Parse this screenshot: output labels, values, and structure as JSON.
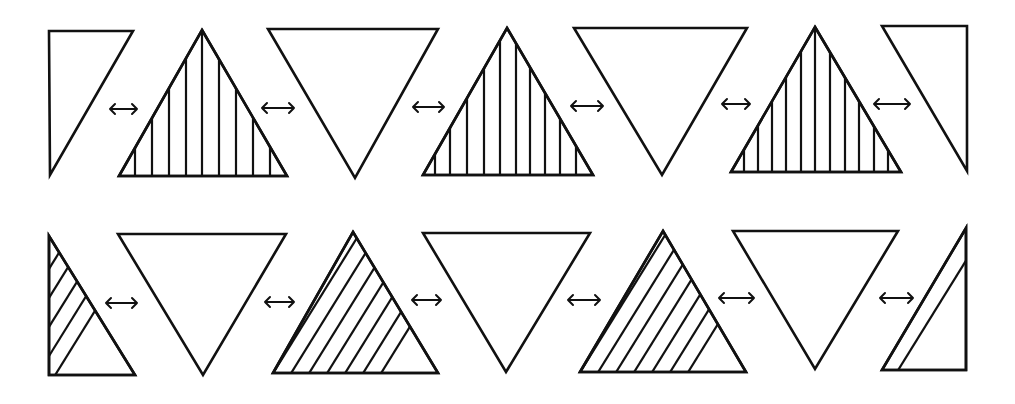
{
  "diagram": {
    "colors": {
      "line": "#111111",
      "background": "#ffffff"
    },
    "rows": [
      {
        "name": "row-1",
        "hatch_style": "vertical",
        "shapes": [
          {
            "id": "r1-t1",
            "kind": "half-triangle-left",
            "points": [
              [
                49,
                31
              ],
              [
                133,
                31
              ],
              [
                50,
                175
              ]
            ],
            "hatch": null
          },
          {
            "id": "r1-t2",
            "kind": "triangle-up",
            "points": [
              [
                202,
                30
              ],
              [
                287,
                176
              ],
              [
                119,
                176
              ]
            ],
            "hatch": {
              "type": "vertical",
              "xs": [
                135,
                152,
                169,
                186,
                202,
                219,
                236,
                253,
                270
              ]
            }
          },
          {
            "id": "r1-t3",
            "kind": "triangle-down",
            "points": [
              [
                268,
                29
              ],
              [
                438,
                29
              ],
              [
                355,
                178
              ]
            ],
            "hatch": null
          },
          {
            "id": "r1-t4",
            "kind": "triangle-up",
            "points": [
              [
                507,
                28
              ],
              [
                593,
                175
              ],
              [
                423,
                175
              ]
            ],
            "hatch": {
              "type": "vertical",
              "xs": [
                435,
                450,
                467,
                484,
                500,
                516,
                530,
                545,
                560,
                576
              ]
            }
          },
          {
            "id": "r1-t5",
            "kind": "triangle-down",
            "points": [
              [
                574,
                28
              ],
              [
                747,
                28
              ],
              [
                662,
                175
              ]
            ],
            "hatch": null
          },
          {
            "id": "r1-t6",
            "kind": "triangle-up",
            "points": [
              [
                815,
                27
              ],
              [
                901,
                172
              ],
              [
                731,
                172
              ]
            ],
            "hatch": {
              "type": "vertical",
              "xs": [
                744,
                758,
                772,
                786,
                801,
                815,
                830,
                845,
                859,
                874,
                888
              ]
            }
          },
          {
            "id": "r1-t7",
            "kind": "half-triangle-right",
            "points": [
              [
                882,
                26
              ],
              [
                967,
                26
              ],
              [
                967,
                171
              ]
            ],
            "hatch": null
          }
        ],
        "arrows": [
          {
            "id": "r1-a1",
            "x1": 110,
            "x2": 137,
            "y": 109
          },
          {
            "id": "r1-a2",
            "x1": 262,
            "x2": 294,
            "y": 108
          },
          {
            "id": "r1-a3",
            "x1": 413,
            "x2": 444,
            "y": 107
          },
          {
            "id": "r1-a4",
            "x1": 571,
            "x2": 603,
            "y": 106
          },
          {
            "id": "r1-a5",
            "x1": 722,
            "x2": 750,
            "y": 104
          },
          {
            "id": "r1-a6",
            "x1": 874,
            "x2": 910,
            "y": 104
          }
        ]
      },
      {
        "name": "row-2",
        "hatch_style": "diagonal",
        "shapes": [
          {
            "id": "r2-t1",
            "kind": "half-triangle-left",
            "points": [
              [
                49,
                236
              ],
              [
                135,
                375
              ],
              [
                49,
                375
              ]
            ],
            "hatch": {
              "type": "diagonal",
              "offsets": [
                -170,
                -152,
                -134,
                -116,
                -98,
                -80,
                -62,
                -44,
                -26
              ]
            }
          },
          {
            "id": "r2-t2",
            "kind": "triangle-down",
            "points": [
              [
                118,
                234
              ],
              [
                286,
                234
              ],
              [
                203,
                375
              ]
            ],
            "hatch": null
          },
          {
            "id": "r2-t3",
            "kind": "triangle-up",
            "points": [
              [
                353,
                232
              ],
              [
                438,
                373
              ],
              [
                273,
                373
              ]
            ],
            "hatch": {
              "type": "diagonal",
              "offsets": [
                -140,
                -122,
                -104,
                -86,
                -68,
                -50,
                -32,
                -14,
                4,
                22,
                40,
                58,
                76
              ]
            }
          },
          {
            "id": "r2-t4",
            "kind": "triangle-down",
            "points": [
              [
                423,
                233
              ],
              [
                590,
                233
              ],
              [
                506,
                372
              ]
            ],
            "hatch": null
          },
          {
            "id": "r2-t5",
            "kind": "triangle-up",
            "points": [
              [
                663,
                231
              ],
              [
                746,
                372
              ],
              [
                580,
                372
              ]
            ],
            "hatch": {
              "type": "diagonal",
              "offsets": [
                -140,
                -122,
                -104,
                -86,
                -68,
                -50,
                -32,
                -14,
                4,
                22,
                40,
                58,
                76
              ]
            }
          },
          {
            "id": "r2-t6",
            "kind": "triangle-down",
            "points": [
              [
                733,
                231
              ],
              [
                898,
                231
              ],
              [
                815,
                369
              ]
            ],
            "hatch": null
          },
          {
            "id": "r2-t7",
            "kind": "half-triangle-right",
            "points": [
              [
                966,
                228
              ],
              [
                966,
                370
              ],
              [
                882,
                370
              ]
            ],
            "hatch": {
              "type": "diagonal",
              "offsets": [
                -116,
                -96,
                -76,
                -56,
                -36,
                -16
              ]
            }
          }
        ],
        "arrows": [
          {
            "id": "r2-a1",
            "x1": 106,
            "x2": 137,
            "y": 303
          },
          {
            "id": "r2-a2",
            "x1": 265,
            "x2": 294,
            "y": 302
          },
          {
            "id": "r2-a3",
            "x1": 412,
            "x2": 441,
            "y": 300
          },
          {
            "id": "r2-a4",
            "x1": 568,
            "x2": 600,
            "y": 300
          },
          {
            "id": "r2-a5",
            "x1": 719,
            "x2": 754,
            "y": 298
          },
          {
            "id": "r2-a6",
            "x1": 880,
            "x2": 913,
            "y": 298
          }
        ]
      }
    ]
  }
}
